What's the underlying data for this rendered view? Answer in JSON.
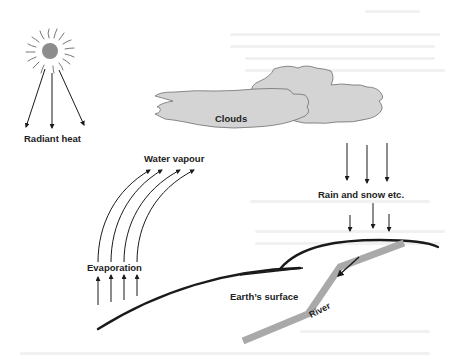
{
  "diagram": {
    "labels": {
      "radiant_heat": "Radiant heat",
      "clouds": "Clouds",
      "water_vapour": "Water vapour",
      "rain_and_snow": "Rain and snow etc.",
      "evaporation": "Evaporation",
      "earths_surface": "Earth’s surface",
      "river": "River"
    },
    "icons": {
      "sun": "sun-icon",
      "arrows": "arrow-icon"
    },
    "colors": {
      "cloud_fill": "#d4d4d4",
      "cloud_stroke": "#6f6f6f",
      "sun_core": "#8c8c8c",
      "river": "#a9a9a9",
      "line": "#1a1a1a",
      "text": "#222222"
    }
  }
}
